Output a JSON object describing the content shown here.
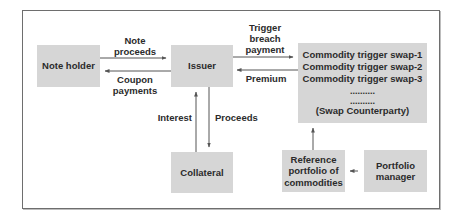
{
  "diagram": {
    "nodes": {
      "note_holder": "Note holder",
      "issuer": "Issuer",
      "swap": {
        "lines": [
          "Commodity trigger swap-1",
          "Commodity trigger swap-2",
          "Commodity trigger swap-3",
          "..........",
          "..........",
          "(Swap Counterparty)"
        ]
      },
      "collateral": "Collateral",
      "reference_portfolio": {
        "lines": [
          "Reference",
          "portfolio of",
          "commodities"
        ]
      },
      "portfolio_manager": {
        "lines": [
          "Portfolio",
          "manager"
        ]
      }
    },
    "edges": {
      "note_proceeds": {
        "lines": [
          "Note",
          "proceeds"
        ],
        "from": "Note holder",
        "to": "Issuer"
      },
      "coupon_payments": {
        "lines": [
          "Coupon",
          "payments"
        ],
        "from": "Issuer",
        "to": "Note holder"
      },
      "trigger_breach_payment": {
        "lines": [
          "Trigger",
          "breach",
          "payment"
        ],
        "from": "Issuer",
        "to": "Swap Counterparty"
      },
      "premium": {
        "lines": [
          "Premium"
        ],
        "from": "Swap Counterparty",
        "to": "Issuer"
      },
      "interest": {
        "lines": [
          "Interest"
        ],
        "from": "Collateral",
        "to": "Issuer"
      },
      "proceeds": {
        "lines": [
          "Proceeds"
        ],
        "from": "Issuer",
        "to": "Collateral"
      },
      "reference_to_swap": {
        "from": "Reference portfolio of commodities",
        "to": "Swap Counterparty"
      },
      "manager_to_reference": {
        "from": "Portfolio manager",
        "to": "Reference portfolio of commodities"
      }
    },
    "colors": {
      "box_fill": "#d6d6d6",
      "line": "#555555",
      "frame": "#6e6e6e",
      "text": "#2b2b2b"
    }
  }
}
